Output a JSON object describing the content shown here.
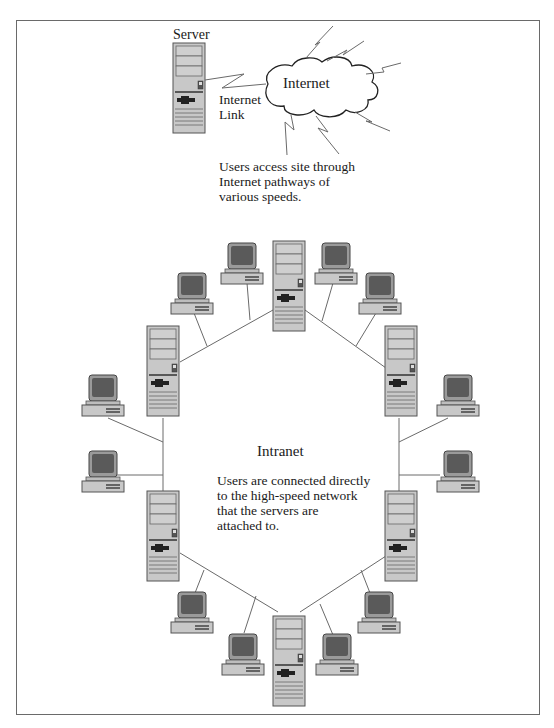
{
  "diagram": {
    "type": "network-diagram",
    "internet_section": {
      "server_label": "Server",
      "cloud_label": "Internet",
      "link_label_line1": "Internet",
      "link_label_line2": "Link",
      "caption_line1": "Users access site through",
      "caption_line2": "Internet pathways of",
      "caption_line3": "various speeds."
    },
    "intranet_section": {
      "title": "Intranet",
      "caption_line1": "Users are connected directly",
      "caption_line2": "to the high-speed network",
      "caption_line3": "that the servers are",
      "caption_line4": "attached to.",
      "server_count": 6,
      "workstation_count": 12,
      "topology": "ring"
    },
    "colors": {
      "frame": "#6a6a6a",
      "device_fill": "#c8c8c8",
      "device_stroke": "#555555",
      "screen": "#5a5a5a",
      "line": "#6a6a6a",
      "text": "#1a1a1a"
    }
  }
}
